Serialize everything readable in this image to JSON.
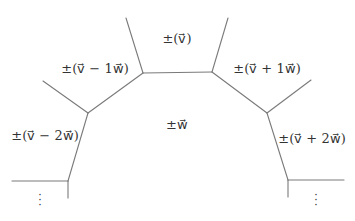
{
  "diagram": {
    "type": "graph-regions",
    "line_color": "#7a7a7a",
    "text_color": "#333333",
    "regions": [
      {
        "id": "top",
        "label": "±(v⃗)",
        "x": 177,
        "y": 38
      },
      {
        "id": "minus1",
        "label": "±(v⃗ − 1w⃗)",
        "x": 95,
        "y": 68
      },
      {
        "id": "plus1",
        "label": "±(v⃗ + 1w⃗)",
        "x": 267,
        "y": 68
      },
      {
        "id": "center",
        "label": "±w⃗",
        "x": 177,
        "y": 124
      },
      {
        "id": "minus2",
        "label": "±(v⃗ − 2w⃗)",
        "x": 45,
        "y": 135
      },
      {
        "id": "plus2",
        "label": "±(v⃗ + 2w⃗)",
        "x": 312,
        "y": 138
      }
    ],
    "continuation": [
      {
        "id": "left-dots",
        "label": "⋮",
        "x": 40,
        "y": 193
      },
      {
        "id": "right-dots",
        "label": "⋮",
        "x": 316,
        "y": 193
      }
    ],
    "edges": [
      [
        143,
        73,
        212,
        72
      ],
      [
        143,
        73,
        126,
        18
      ],
      [
        212,
        72,
        228,
        18
      ],
      [
        143,
        73,
        88,
        113
      ],
      [
        212,
        72,
        267,
        113
      ],
      [
        88,
        113,
        43,
        81
      ],
      [
        267,
        113,
        311,
        80
      ],
      [
        88,
        113,
        68,
        181
      ],
      [
        267,
        113,
        288,
        180
      ],
      [
        12,
        181,
        68,
        181
      ],
      [
        68,
        181,
        68,
        198
      ],
      [
        288,
        180,
        344,
        180
      ],
      [
        288,
        180,
        288,
        197
      ]
    ]
  }
}
